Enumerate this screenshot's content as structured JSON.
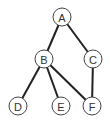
{
  "diagram": {
    "type": "graph",
    "nodes": [
      {
        "id": "A",
        "label": "A",
        "x": 62,
        "y": 17
      },
      {
        "id": "B",
        "label": "B",
        "x": 44,
        "y": 59
      },
      {
        "id": "C",
        "label": "C",
        "x": 93,
        "y": 59
      },
      {
        "id": "D",
        "label": "D",
        "x": 18,
        "y": 106
      },
      {
        "id": "E",
        "label": "E",
        "x": 61,
        "y": 106
      },
      {
        "id": "F",
        "label": "F",
        "x": 92,
        "y": 106
      }
    ],
    "edges": [
      {
        "from": "A",
        "to": "B"
      },
      {
        "from": "A",
        "to": "C"
      },
      {
        "from": "B",
        "to": "D"
      },
      {
        "from": "B",
        "to": "E"
      },
      {
        "from": "B",
        "to": "F"
      },
      {
        "from": "C",
        "to": "F"
      }
    ],
    "node_radius": 9,
    "colors": {
      "edge": "#222222",
      "node_stroke": "#444444",
      "node_fill": "#ffffff",
      "label": "#333333"
    }
  }
}
